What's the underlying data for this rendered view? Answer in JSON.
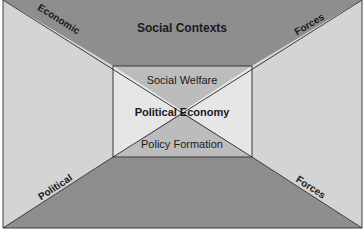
{
  "diagram": {
    "title": "Social Contexts",
    "center": {
      "top": "Social Welfare",
      "middle": "Political Economy",
      "bottom": "Policy Formation"
    },
    "diagonal_labels": {
      "top_left": "Economic",
      "top_right": "Forces",
      "bottom_left": "Political",
      "bottom_right": "Forces"
    },
    "colors": {
      "outer_top_bottom": "#8e8e8e",
      "outer_left_right": "#d4d4d4",
      "inner_top_bottom": "#bcbcbc",
      "inner_left_right": "#e6e6e6",
      "lines": "#3a3a3a"
    }
  }
}
